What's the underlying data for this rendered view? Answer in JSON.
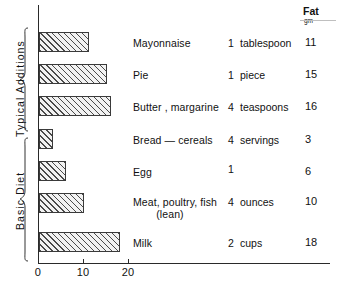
{
  "chart_data": {
    "type": "bar",
    "orientation": "horizontal",
    "title": "",
    "xlabel": "",
    "ylabel": "",
    "xlim": [
      0,
      64
    ],
    "xticks": [
      0,
      10,
      20
    ],
    "xtick_labels": [
      "0",
      "10",
      "20"
    ],
    "grid": false,
    "legend": false,
    "value_column_header": "Fat",
    "value_column_units": "gm",
    "categories": [
      "Mayonnaise",
      "Pie",
      "Butter , margarine",
      "Bread — cereals",
      "Egg",
      "Meat, poultry, fish (lean)",
      "Milk"
    ],
    "values": [
      11,
      15,
      16,
      3,
      6,
      10,
      18
    ],
    "rows": [
      {
        "name": "Mayonnaise",
        "name2": "",
        "qty": "1",
        "unit": "tablespoon",
        "fat": "11",
        "value": 11
      },
      {
        "name": "Pie",
        "name2": "",
        "qty": "1",
        "unit": "piece",
        "fat": "15",
        "value": 15
      },
      {
        "name": "Butter , margarine",
        "name2": "",
        "qty": "4",
        "unit": "teaspoons",
        "fat": "16",
        "value": 16
      },
      {
        "name": "Bread — cereals",
        "name2": "",
        "qty": "4",
        "unit": "servings",
        "fat": "3",
        "value": 3
      },
      {
        "name": "Egg",
        "name2": "",
        "qty": "1",
        "unit": "",
        "fat": "6",
        "value": 6
      },
      {
        "name": "Meat, poultry, fish",
        "name2": "(lean)",
        "qty": "4",
        "unit": "ounces",
        "fat": "10",
        "value": 10
      },
      {
        "name": "Milk",
        "name2": "",
        "qty": "2",
        "unit": "cups",
        "fat": "18",
        "value": 18
      }
    ],
    "groups": [
      {
        "label": "Typical Additions",
        "rows": [
          0,
          1,
          2
        ]
      },
      {
        "label": "Basic Diet",
        "rows": [
          3,
          4,
          5,
          6
        ]
      }
    ],
    "colors": {
      "axis": "#2a2a2a",
      "bar_outline": "#3a3a3a",
      "bar_hatch": "#4a4a4a",
      "bar_fill": "#f2f2f2",
      "text": "#111111",
      "background": "#ffffff"
    }
  }
}
